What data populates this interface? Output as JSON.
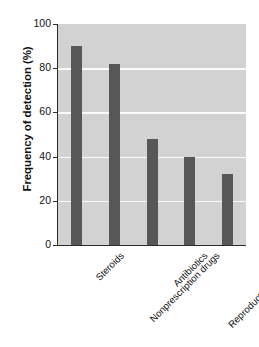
{
  "chart_data": {
    "type": "bar",
    "title": "",
    "subtitle": "",
    "xlabel": "",
    "ylabel": "Frequency of detection (%)",
    "categories": [
      "Steroids",
      "Nonprescription drugs",
      "Antibiotics",
      "Reproductive hormones",
      "Other prescription drugs"
    ],
    "values": [
      90,
      82,
      48,
      40,
      32
    ],
    "ylim": [
      0,
      100
    ],
    "yticks": [
      0,
      20,
      40,
      60,
      80,
      100
    ],
    "ytick_labels": [
      "0",
      "20",
      "40",
      "60",
      "80",
      "100"
    ],
    "xtick_rotation": -45,
    "grid": "horizontal-white",
    "legend": "none",
    "annotations": [],
    "colors": {
      "bar": "#575757",
      "plot_background": "#d2d2d2",
      "gridline": "#fbfbfb",
      "axis": "#2b2b2b",
      "text": "#111111",
      "figure_background": "#ffffff"
    }
  }
}
